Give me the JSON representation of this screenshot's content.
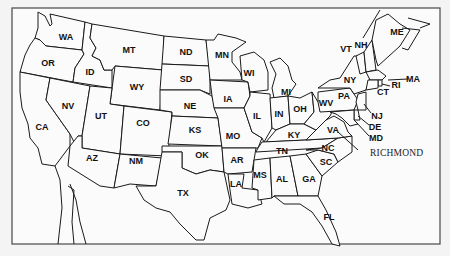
{
  "map": {
    "title": "United States map with state abbreviations",
    "states": [
      {
        "abbr": "WA"
      },
      {
        "abbr": "OR"
      },
      {
        "abbr": "CA"
      },
      {
        "abbr": "ID"
      },
      {
        "abbr": "NV"
      },
      {
        "abbr": "MT"
      },
      {
        "abbr": "WY"
      },
      {
        "abbr": "UT"
      },
      {
        "abbr": "AZ"
      },
      {
        "abbr": "CO"
      },
      {
        "abbr": "NM"
      },
      {
        "abbr": "ND"
      },
      {
        "abbr": "SD"
      },
      {
        "abbr": "NE"
      },
      {
        "abbr": "KS"
      },
      {
        "abbr": "OK"
      },
      {
        "abbr": "TX"
      },
      {
        "abbr": "MN"
      },
      {
        "abbr": "IA"
      },
      {
        "abbr": "MO"
      },
      {
        "abbr": "AR"
      },
      {
        "abbr": "LA"
      },
      {
        "abbr": "WI"
      },
      {
        "abbr": "IL"
      },
      {
        "abbr": "MI"
      },
      {
        "abbr": "IN"
      },
      {
        "abbr": "OH"
      },
      {
        "abbr": "KY"
      },
      {
        "abbr": "TN"
      },
      {
        "abbr": "MS"
      },
      {
        "abbr": "AL"
      },
      {
        "abbr": "GA"
      },
      {
        "abbr": "FL"
      },
      {
        "abbr": "SC"
      },
      {
        "abbr": "NC"
      },
      {
        "abbr": "VA"
      },
      {
        "abbr": "WV"
      },
      {
        "abbr": "PA"
      },
      {
        "abbr": "NY"
      },
      {
        "abbr": "VT"
      },
      {
        "abbr": "NH"
      },
      {
        "abbr": "ME"
      },
      {
        "abbr": "MA"
      },
      {
        "abbr": "RI"
      },
      {
        "abbr": "CT"
      },
      {
        "abbr": "NJ"
      },
      {
        "abbr": "DE"
      },
      {
        "abbr": "MD"
      }
    ],
    "highlighted_city": {
      "name": "Richmond",
      "display": "RICHMOND",
      "state": "VA"
    }
  }
}
